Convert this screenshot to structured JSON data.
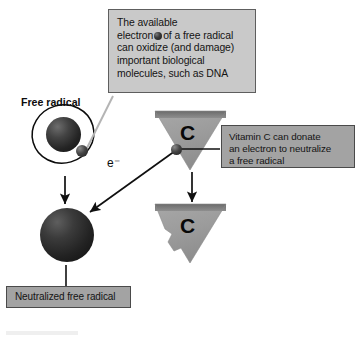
{
  "figure": {
    "background_color": "#ffffff"
  },
  "colors": {
    "callout_light_fill": "#c9c9c9",
    "callout_mid_fill": "#a3a3a3",
    "callout_border": "#4a4a4a",
    "triangle_fill": "#9a9a9a",
    "triangle_top_edge": "#6f6f6f",
    "sphere_dark": "#1d1d1d",
    "arrow_color": "#101010",
    "leader_line_light": "#b4b4b4",
    "text_color": "#141414"
  },
  "callouts": {
    "oxidize": {
      "name": "oxidize-callout",
      "style": "light",
      "lines": [
        "The available",
        "of a free radical",
        "can oxidize (and damage)",
        "important biological",
        "molecules, such as DNA"
      ],
      "line_electron_prefix": "electron",
      "full_text": "The available electron of a free radical can oxidize (and damage) important biological molecules, such as DNA",
      "has_inline_electron_icon": true
    },
    "vitamin_c": {
      "name": "vitamin-c-callout",
      "style": "mid",
      "lines": [
        "Vitamin C can donate",
        "an electron to neutralize",
        "a free radical"
      ],
      "full_text": "Vitamin C can donate an electron to neutralize a free radical"
    },
    "neutralized": {
      "name": "neutralized-callout",
      "style": "mid",
      "text": "Neutralized free radical"
    }
  },
  "labels": {
    "free_radical": "Free radical",
    "electron_transfer": "e⁻",
    "vitamin_c_letter_top": "C",
    "vitamin_c_letter_bottom": "C"
  },
  "elements": {
    "free_radical_nucleus": "free-radical-nucleus-sphere",
    "free_radical_orbit": "electron-orbit-ring",
    "free_radical_electron": "unpaired-electron-sphere",
    "neutralized_radical_sphere": "neutralized-radical-sphere",
    "vitamin_c_triangle_top": "vitamin-c-triangle-intact",
    "vitamin_c_triangle_bottom": "vitamin-c-triangle-depleted",
    "vitamin_c_electron": "vitamin-c-donated-electron"
  },
  "arrows": [
    {
      "name": "radical-to-neutralized-arrow",
      "direction": "down",
      "from": "free radical",
      "to": "neutralized free radical"
    },
    {
      "name": "electron-transfer-arrow",
      "direction": "down-left",
      "label": "e⁻",
      "from": "vitamin C electron",
      "to": "neutralized free radical"
    },
    {
      "name": "vitamin-c-transform-arrow",
      "direction": "down",
      "from": "intact vitamin C",
      "to": "depleted vitamin C"
    }
  ],
  "leader_lines": [
    {
      "name": "oxidize-callout-leader",
      "from": "oxidize-callout",
      "to": "unpaired-electron-sphere",
      "color": "#b4b4b4"
    },
    {
      "name": "vitamin-c-callout-leader",
      "from": "vitamin-c-callout",
      "to": "vitamin-c-donated-electron",
      "color": "#111111"
    },
    {
      "name": "neutralized-callout-leader",
      "from": "neutralized-callout",
      "to": "neutralized-radical-sphere",
      "color": "#111111"
    }
  ]
}
